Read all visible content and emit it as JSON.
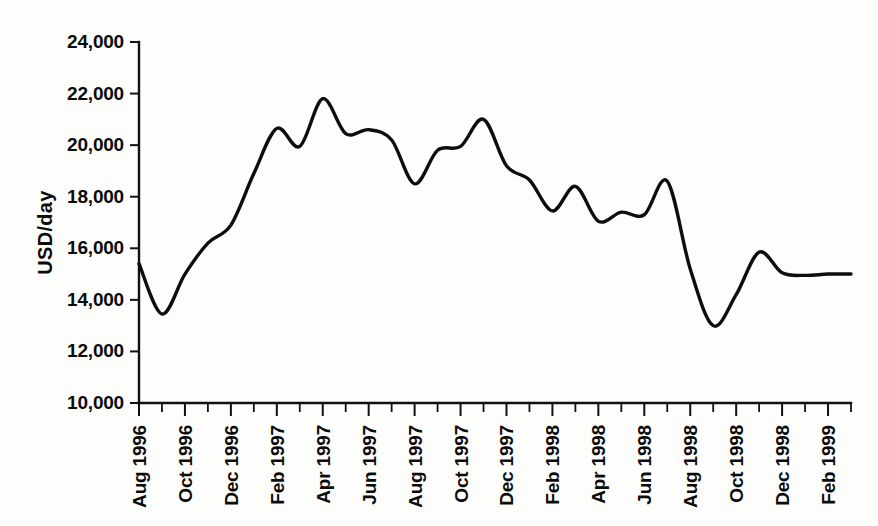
{
  "chart_data": {
    "type": "line",
    "title": "",
    "subtitle": "",
    "xlabel": "",
    "ylabel": "USD/day",
    "ylim": [
      10000,
      24000
    ],
    "y_ticks": [
      10000,
      12000,
      14000,
      16000,
      18000,
      20000,
      22000,
      24000
    ],
    "y_tick_labels": [
      "10,000",
      "12,000",
      "14,000",
      "16,000",
      "18,000",
      "20,000",
      "22,000",
      "24,000"
    ],
    "grid": false,
    "legend": false,
    "legend_position": "none",
    "x_tick_labels": [
      "Aug 1996",
      "Oct 1996",
      "Dec 1996",
      "Feb 1997",
      "Apr 1997",
      "Jun 1997",
      "Aug 1997",
      "Oct 1997",
      "Dec 1997",
      "Feb 1998",
      "Apr 1998",
      "Jun 1998",
      "Aug 1998",
      "Oct 1998",
      "Dec 1998",
      "Feb 1999"
    ],
    "x_minor_interval_months": 1,
    "x_label_interval_months": 2,
    "line_color": "#0d0d0d",
    "background_color": "#fdfdfb",
    "x": [
      "Aug 1996",
      "Sep 1996",
      "Oct 1996",
      "Nov 1996",
      "Dec 1996",
      "Jan 1997",
      "Feb 1997",
      "Mar 1997",
      "Apr 1997",
      "May 1997",
      "Jun 1997",
      "Jul 1997",
      "Aug 1997",
      "Sep 1997",
      "Oct 1997",
      "Nov 1997",
      "Dec 1997",
      "Jan 1998",
      "Feb 1998",
      "Mar 1998",
      "Apr 1998",
      "May 1998",
      "Jun 1998",
      "Jul 1998",
      "Aug 1998",
      "Sep 1998",
      "Oct 1998",
      "Nov 1998",
      "Dec 1998",
      "Jan 1999",
      "Feb 1999",
      "Mar 1999"
    ],
    "values": [
      15400,
      13450,
      15000,
      16200,
      16900,
      18900,
      20650,
      19950,
      21800,
      20450,
      20600,
      20200,
      18500,
      19800,
      19950,
      21000,
      19200,
      18650,
      17450,
      18400,
      17050,
      17400,
      17300,
      18600,
      15200,
      13000,
      14200,
      15850,
      15050,
      14950,
      15000,
      15000
    ],
    "annotations": {
      "peak_value": 21800,
      "peak_label": "Apr 1997",
      "min_value": 13000,
      "min_label": "Sep 1998"
    }
  }
}
